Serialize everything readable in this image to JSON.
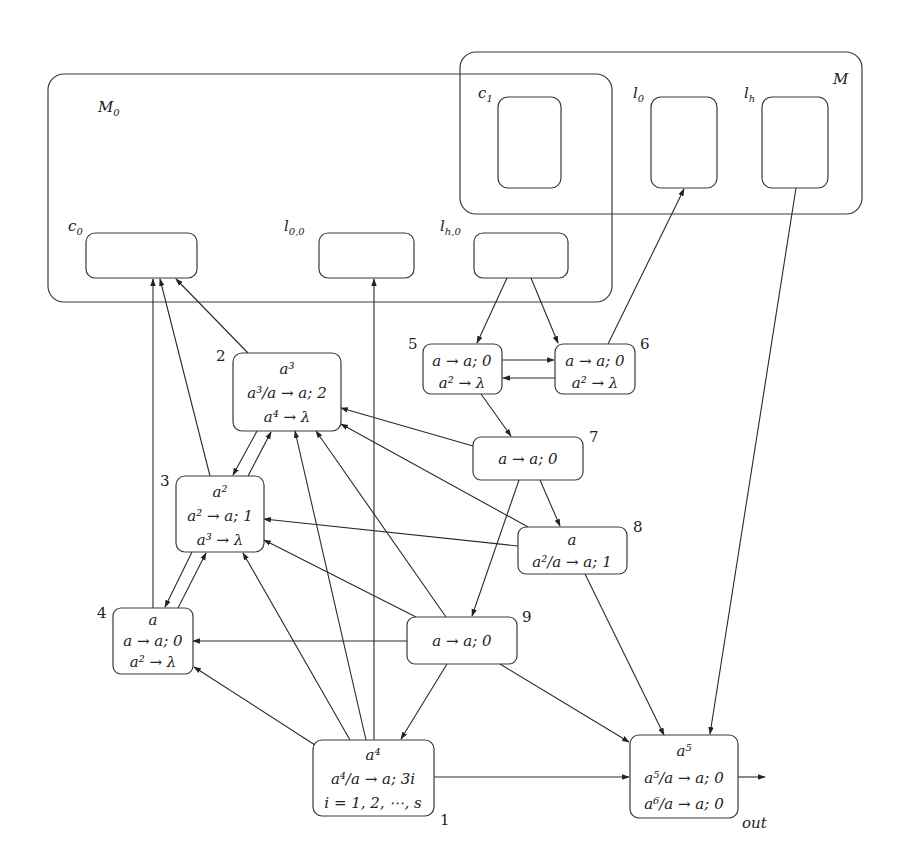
{
  "modules": {
    "M0": {
      "label": "M",
      "sub": "0"
    },
    "M": {
      "label": "M"
    }
  },
  "registers": {
    "c0": {
      "label": "c",
      "sub": "0"
    },
    "l00": {
      "label": "l",
      "sub": "0,0"
    },
    "lh0": {
      "label": "l",
      "sub": "h,0"
    },
    "c1": {
      "label": "c",
      "sub": "1"
    },
    "l0": {
      "label": "l",
      "sub": "0"
    },
    "lh": {
      "label": "l",
      "sub": "h"
    }
  },
  "neurons": [
    {
      "id": "1",
      "number": "1",
      "lines": [
        "a⁴",
        "a⁴/a → a; 3i",
        "i = 1, 2, ⋯, s"
      ]
    },
    {
      "id": "2",
      "number": "2",
      "lines": [
        "a³",
        "a³/a → a; 2",
        "a⁴ → λ"
      ]
    },
    {
      "id": "3",
      "number": "3",
      "lines": [
        "a²",
        "a² → a; 1",
        "a³ → λ"
      ]
    },
    {
      "id": "4",
      "number": "4",
      "lines": [
        "a",
        "a → a; 0",
        "a² → λ"
      ]
    },
    {
      "id": "5",
      "number": "5",
      "lines": [
        "a → a; 0",
        "a² → λ"
      ]
    },
    {
      "id": "6",
      "number": "6",
      "lines": [
        "a → a; 0",
        "a² → λ"
      ]
    },
    {
      "id": "7",
      "number": "7",
      "lines": [
        "a → a; 0"
      ]
    },
    {
      "id": "8",
      "number": "8",
      "lines": [
        "a",
        "a²/a → a; 1"
      ]
    },
    {
      "id": "9",
      "number": "9",
      "lines": [
        "a → a; 0"
      ]
    },
    {
      "id": "out",
      "number": "out",
      "lines": [
        "a⁵",
        "a⁵/a → a; 0",
        "a⁶/a → a; 0"
      ]
    }
  ],
  "edges": [
    {
      "from": "lh0",
      "to": "5"
    },
    {
      "from": "lh0",
      "to": "6"
    },
    {
      "from": "5",
      "to": "6"
    },
    {
      "from": "6",
      "to": "5"
    },
    {
      "from": "6",
      "to": "l0"
    },
    {
      "from": "5",
      "to": "7"
    },
    {
      "from": "7",
      "to": "2"
    },
    {
      "from": "7",
      "to": "8"
    },
    {
      "from": "7",
      "to": "9"
    },
    {
      "from": "8",
      "to": "2"
    },
    {
      "from": "8",
      "to": "3"
    },
    {
      "from": "8",
      "to": "out"
    },
    {
      "from": "9",
      "to": "2"
    },
    {
      "from": "9",
      "to": "3"
    },
    {
      "from": "9",
      "to": "4"
    },
    {
      "from": "9",
      "to": "1"
    },
    {
      "from": "9",
      "to": "out"
    },
    {
      "from": "2",
      "to": "c0"
    },
    {
      "from": "2",
      "to": "3"
    },
    {
      "from": "3",
      "to": "2"
    },
    {
      "from": "3",
      "to": "c0"
    },
    {
      "from": "3",
      "to": "4"
    },
    {
      "from": "4",
      "to": "3"
    },
    {
      "from": "4",
      "to": "c0"
    },
    {
      "from": "1",
      "to": "4"
    },
    {
      "from": "1",
      "to": "3"
    },
    {
      "from": "1",
      "to": "2"
    },
    {
      "from": "1",
      "to": "l00"
    },
    {
      "from": "1",
      "to": "out"
    },
    {
      "from": "lh",
      "to": "out"
    },
    {
      "from": "out",
      "to": "environment"
    }
  ]
}
